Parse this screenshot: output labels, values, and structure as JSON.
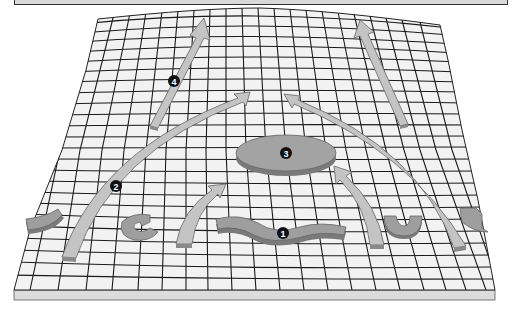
{
  "diagram": {
    "type": "3d-grid-surface-with-arrows",
    "colors": {
      "background": "#ffffff",
      "grid_fill": "#f2f2f2",
      "grid_lines": "#1a1a1a",
      "arrow_fill": "#c4c4c4",
      "arrow_edge": "#8a8a8a",
      "shape_fill": "#9e9e9e",
      "shape_side": "#7a7a7a",
      "base_side": "#dcdcdc",
      "badge_fill": "#111111",
      "badge_text": "#ffffff"
    },
    "labels": [
      {
        "id": "1",
        "text": "1",
        "target": "wavy-strip"
      },
      {
        "id": "2",
        "text": "2",
        "target": "left-long-curved-arrow"
      },
      {
        "id": "3",
        "text": "3",
        "target": "central-disc"
      },
      {
        "id": "4",
        "text": "4",
        "target": "upper-left-straight-arrow"
      }
    ]
  }
}
